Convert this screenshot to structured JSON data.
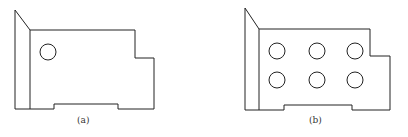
{
  "figures": [
    {
      "label": "(a)",
      "hole_count": 1
    },
    {
      "label": "(b)",
      "hole_count": 6
    }
  ],
  "colors": {
    "stroke": "#222222",
    "background": "#ffffff"
  }
}
